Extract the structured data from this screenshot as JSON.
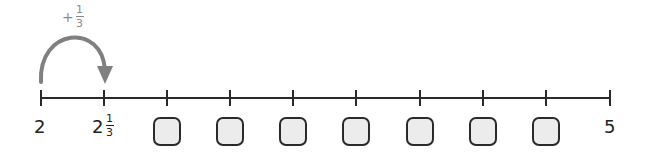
{
  "number_line": {
    "start_label": "2",
    "end_label": "5",
    "second_label_whole": "2",
    "second_label_num": "1",
    "second_label_den": "3",
    "tick_count": 10,
    "interval": "1/3",
    "blank_boxes": 7
  },
  "jump": {
    "sign": "+",
    "num": "1",
    "den": "3",
    "from": "2",
    "to": "2 1/3"
  },
  "colors": {
    "line": "#2a2a2a",
    "arrow": "#808080",
    "box_fill": "#ececec",
    "box_border": "#2a2a2a",
    "jump_label": "#8a8a8a"
  }
}
